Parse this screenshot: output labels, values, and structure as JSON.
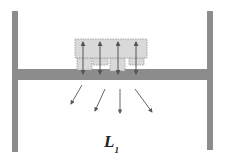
{
  "diagram": {
    "label": {
      "main": "L",
      "subscript": "1"
    },
    "colors": {
      "post": "#8c8c8c",
      "beam": "#8c8c8c",
      "block_fill": "#d9d9d9",
      "block_stroke": "#9a9a9a",
      "arrow": "#555555"
    },
    "posts": [
      {
        "name": "left-post",
        "x": 12,
        "y": 11,
        "w": 6,
        "h": 141
      },
      {
        "name": "right-post",
        "x": 207,
        "y": 11,
        "w": 6,
        "h": 139
      }
    ],
    "beam": {
      "x": 18,
      "y": 69,
      "w": 189,
      "h": 11
    },
    "top_block": {
      "x": 75,
      "y": 39,
      "w": 72,
      "h": 19
    },
    "sub_blocks": [
      {
        "x": 77,
        "y": 58,
        "w": 15,
        "h": 12
      },
      {
        "x": 93,
        "y": 58,
        "w": 15,
        "h": 7
      },
      {
        "x": 110,
        "y": 58,
        "w": 15,
        "h": 13
      },
      {
        "x": 129,
        "y": 58,
        "w": 15,
        "h": 7
      }
    ],
    "vertical_arrows": [
      {
        "x": 83,
        "y1": 42,
        "y2": 74
      },
      {
        "x": 100,
        "y1": 42,
        "y2": 74
      },
      {
        "x": 118,
        "y1": 42,
        "y2": 74
      },
      {
        "x": 136,
        "y1": 42,
        "y2": 74
      }
    ],
    "diagonal_arrows": [
      {
        "x1": 82,
        "y1": 85,
        "x2": 71,
        "y2": 104
      },
      {
        "x1": 105,
        "y1": 89,
        "x2": 95,
        "y2": 111
      },
      {
        "x1": 120,
        "y1": 89,
        "x2": 120,
        "y2": 113
      },
      {
        "x1": 135,
        "y1": 89,
        "x2": 152,
        "y2": 112
      }
    ]
  }
}
